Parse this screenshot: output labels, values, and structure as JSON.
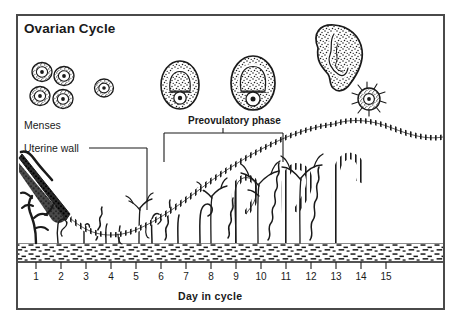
{
  "figure": {
    "title": "Ovarian Cycle",
    "background_color": "#ffffff",
    "frame_color": "#4a4a4a",
    "ink_color": "#1a1a1a"
  },
  "labels": {
    "menses": "Menses",
    "uterine_wall": "Uterine wall",
    "preovulatory_phase": "Preovulatory phase"
  },
  "axis": {
    "title": "Day in cycle",
    "ticks": [
      "1",
      "2",
      "3",
      "4",
      "5",
      "6",
      "7",
      "8",
      "9",
      "10",
      "11",
      "12",
      "13",
      "14",
      "15"
    ]
  },
  "chart_data": {
    "type": "line",
    "title": "Ovarian Cycle",
    "xlabel": "Day in cycle",
    "ylabel": "",
    "x": [
      1,
      2,
      3,
      4,
      5,
      6,
      7,
      8,
      9,
      10,
      11,
      12,
      13,
      14,
      15
    ],
    "xlim": [
      1,
      15
    ],
    "grid": false,
    "legend": null,
    "series": [
      {
        "name": "Endometrial thickness (relative)",
        "values": [
          95,
          55,
          28,
          22,
          22,
          26,
          34,
          44,
          56,
          68,
          80,
          92,
          100,
          96,
          90
        ]
      }
    ],
    "annotations": [
      {
        "text": "Menses",
        "x_range": [
          1,
          5
        ]
      },
      {
        "text": "Uterine wall",
        "x": 6
      },
      {
        "text": "Preovulatory phase",
        "x_range": [
          6,
          11
        ]
      }
    ]
  },
  "ovarian_stages": [
    {
      "name": "primordial-follicles",
      "day": 2,
      "count": 4,
      "description": "cluster of four primordial follicles"
    },
    {
      "name": "primary-follicle",
      "day": 4,
      "count": 1,
      "description": "single small primary follicle"
    },
    {
      "name": "secondary-follicle",
      "day": 7,
      "count": 1,
      "description": "growing follicle with antrum"
    },
    {
      "name": "graafian-follicle",
      "day": 10,
      "count": 1,
      "description": "mature vesicular follicle"
    },
    {
      "name": "ruptured-follicle",
      "day": 13,
      "count": 1,
      "description": "ruptured follicle releasing ovum"
    },
    {
      "name": "released-ovum",
      "day": 14,
      "count": 1,
      "description": "released ovum with corona radiata"
    }
  ]
}
